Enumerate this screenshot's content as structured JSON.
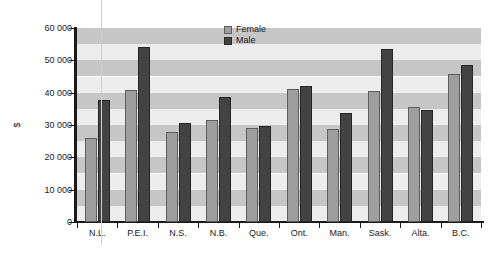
{
  "chart_data": {
    "type": "bar",
    "title": "",
    "xlabel": "",
    "ylabel": "$",
    "categories": [
      "N.L.",
      "P.E.I.",
      "N.S.",
      "N.B.",
      "Que.",
      "Ont.",
      "Man.",
      "Sask.",
      "Alta.",
      "B.C."
    ],
    "series": [
      {
        "name": "Female",
        "color": "#9e9e9e",
        "values": [
          26000,
          40900,
          27800,
          31500,
          29000,
          41200,
          28900,
          40400,
          35500,
          45800
        ]
      },
      {
        "name": "Male",
        "color": "#434343",
        "values": [
          37800,
          54200,
          30700,
          38700,
          29800,
          42000,
          33600,
          53500,
          34500,
          48600
        ]
      }
    ],
    "ylim": [
      0,
      60000
    ],
    "ytick_values": [
      0,
      10000,
      20000,
      30000,
      40000,
      50000,
      60000
    ],
    "ytick_labels": [
      "0",
      "10 000",
      "20 000",
      "30 000",
      "40 000",
      "50 000",
      "60 000"
    ],
    "grid": false,
    "background_bands": true,
    "legend_position": "top-center"
  },
  "legend": {
    "items": [
      {
        "label": "Female",
        "swatch": "female-swatch"
      },
      {
        "label": "Male",
        "swatch": "male-swatch"
      }
    ]
  },
  "axis": {
    "y_label": "$"
  },
  "colors": {
    "female_fill": "#9e9e9e",
    "female_border": "#5d5d5d",
    "male_fill": "#434343",
    "male_border": "#262626",
    "band_light": "#ececec",
    "band_dark": "#c6c6c6",
    "axis": "#1a1a1a"
  }
}
